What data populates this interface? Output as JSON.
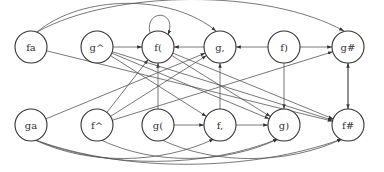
{
  "diagram": {
    "type": "directed-graph",
    "node_radius": 16,
    "nodes": [
      {
        "id": "fa",
        "label": "fa",
        "x": 31,
        "y": 47
      },
      {
        "id": "g^",
        "label": "g^",
        "x": 97,
        "y": 47
      },
      {
        "id": "f(",
        "label": "f(",
        "x": 158,
        "y": 47
      },
      {
        "id": "g,",
        "label": "g,",
        "x": 220,
        "y": 47
      },
      {
        "id": "f)",
        "label": "f)",
        "x": 284,
        "y": 47
      },
      {
        "id": "g#",
        "label": "g#",
        "x": 348,
        "y": 47
      },
      {
        "id": "ga",
        "label": "ga",
        "x": 31,
        "y": 125
      },
      {
        "id": "f^",
        "label": "f^",
        "x": 97,
        "y": 125
      },
      {
        "id": "g(",
        "label": "g(",
        "x": 158,
        "y": 125
      },
      {
        "id": "f,",
        "label": "f,",
        "x": 220,
        "y": 125
      },
      {
        "id": "g)",
        "label": "g)",
        "x": 284,
        "y": 125
      },
      {
        "id": "f#",
        "label": "f#",
        "x": 348,
        "y": 125
      }
    ],
    "edges": [
      {
        "from": "g^",
        "to": "f("
      },
      {
        "from": "f(",
        "to": "f(",
        "kind": "self-loop"
      },
      {
        "from": "g,",
        "to": "f("
      },
      {
        "from": "f)",
        "to": "g,"
      },
      {
        "from": "f)",
        "to": "g#"
      },
      {
        "from": "fa",
        "to": "g,",
        "kind": "arc-top"
      },
      {
        "from": "fa",
        "to": "g#",
        "kind": "arc-top"
      },
      {
        "from": "fa",
        "to": "f#"
      },
      {
        "from": "g(",
        "to": "f("
      },
      {
        "from": "f,",
        "to": "g,"
      },
      {
        "from": "f)",
        "to": "g)"
      },
      {
        "from": "g#",
        "to": "f#"
      },
      {
        "from": "f#",
        "to": "g#"
      },
      {
        "from": "g(",
        "to": "f,"
      },
      {
        "from": "f,",
        "to": "g)"
      },
      {
        "from": "ga",
        "to": "g,"
      },
      {
        "from": "f^",
        "to": "f("
      },
      {
        "from": "f^",
        "to": "g,"
      },
      {
        "from": "f^",
        "to": "g#"
      },
      {
        "from": "g^",
        "to": "f,"
      },
      {
        "from": "g^",
        "to": "g)"
      },
      {
        "from": "g^",
        "to": "f#"
      },
      {
        "from": "f(",
        "to": "g)"
      },
      {
        "from": "f(",
        "to": "f#"
      },
      {
        "from": "ga",
        "to": "f,",
        "kind": "arc-bottom"
      },
      {
        "from": "ga",
        "to": "f#",
        "kind": "arc-bottom"
      },
      {
        "from": "ga",
        "to": "g)",
        "kind": "arc-bottom"
      },
      {
        "from": "f^",
        "to": "g)",
        "kind": "arc-bottom"
      },
      {
        "from": "g(",
        "to": "f#",
        "kind": "arc-bottom"
      }
    ]
  }
}
